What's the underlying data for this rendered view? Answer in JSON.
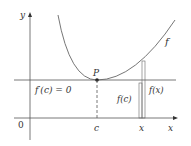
{
  "diagram": {
    "type": "calculus-illustration",
    "axes": {
      "x_label": "x",
      "y_label": "y",
      "origin_label": "0"
    },
    "curve_label": "f",
    "point_label": "P",
    "tangent_label": "f′(c) = 0",
    "c_label": "c",
    "x_tick_label": "x",
    "fc_label": "f(c)",
    "fx_label": "f(x)",
    "colors": {
      "line": "#555555",
      "curve": "#666666",
      "text": "#333333"
    }
  }
}
